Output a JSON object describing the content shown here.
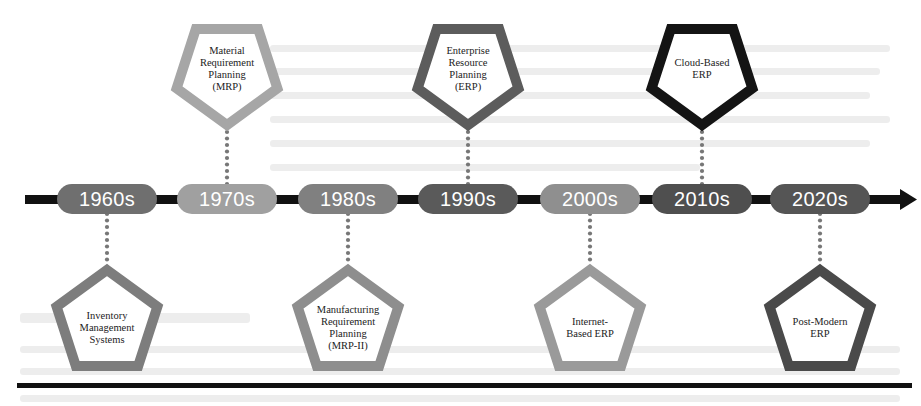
{
  "colors": {
    "bar": "#111111",
    "dots": "#777777",
    "pill_dark": "#5f5f5f",
    "pill_mid": "#7c7c7c",
    "pill_light": "#9e9e9e",
    "penta_light": "#a3a3a3",
    "penta_mid": "#7b7b7b",
    "penta_dark": "#4e4e4e",
    "penta_black": "#111111"
  },
  "timeline": {
    "decades": [
      {
        "label": "1960s",
        "cx": 107,
        "pill_color": "#6f6f6f",
        "milestone": {
          "position": "below",
          "text": "Inventory\nManagement\nSystems",
          "border": "#7d7d7d"
        }
      },
      {
        "label": "1970s",
        "cx": 227,
        "pill_color": "#a0a0a0",
        "milestone": {
          "position": "above",
          "text": "Material\nRequirement\nPlanning\n(MRP)",
          "border": "#a6a6a6"
        }
      },
      {
        "label": "1980s",
        "cx": 348,
        "pill_color": "#808080",
        "milestone": {
          "position": "below",
          "text": "Manufacturing\nRequirement\nPlanning\n(MRP-II)",
          "border": "#8e8e8e"
        }
      },
      {
        "label": "1990s",
        "cx": 468,
        "pill_color": "#5a5a5a",
        "milestone": {
          "position": "above",
          "text": "Enterprise\nResource\nPlanning\n(ERP)",
          "border": "#5c5c5c"
        }
      },
      {
        "label": "2000s",
        "cx": 590,
        "pill_color": "#8f8f8f",
        "milestone": {
          "position": "below",
          "text": "Internet-\nBased ERP",
          "border": "#9a9a9a"
        }
      },
      {
        "label": "2010s",
        "cx": 702,
        "pill_color": "#4f4f4f",
        "milestone": {
          "position": "above",
          "text": "Cloud-Based\nERP",
          "border": "#141414"
        }
      },
      {
        "label": "2020s",
        "cx": 820,
        "pill_color": "#555555",
        "milestone": {
          "position": "below",
          "text": "Post-Modern\nERP",
          "border": "#4a4a4a"
        }
      }
    ]
  }
}
